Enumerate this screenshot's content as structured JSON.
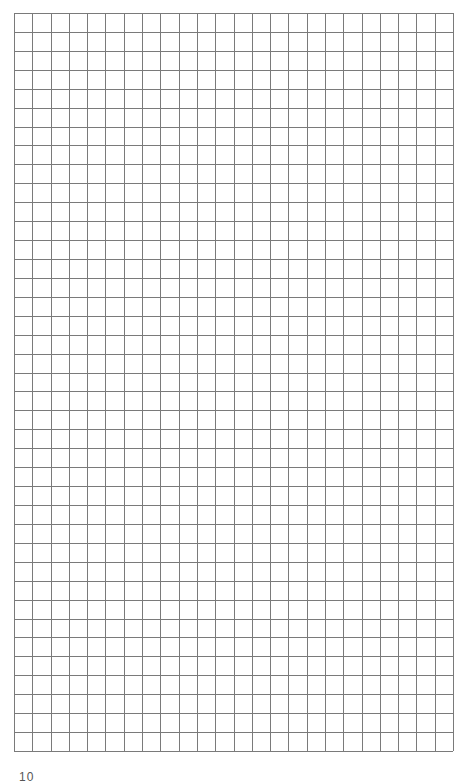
{
  "page": {
    "type": "graph-paper",
    "background_color": "#ffffff",
    "page_number": "10"
  },
  "grid": {
    "columns": 24,
    "rows": 39,
    "line_color": "#7a7a7a",
    "line_width": 1,
    "left": 14,
    "top": 13,
    "width": 439,
    "height": 738
  }
}
